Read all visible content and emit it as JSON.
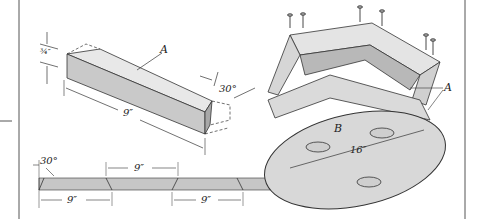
{
  "diagram": {
    "type": "woodworking-assembly-illustration",
    "colors": {
      "line": "#333333",
      "wood_light": "#e6e6e6",
      "wood_mid": "#cfcfcf",
      "wood_dark": "#a8a8a8",
      "disk": "#d9d9d9",
      "border": "#555555"
    },
    "piece_detail": {
      "part_label": "A",
      "thickness_label": "¾″",
      "length_label": "9″",
      "angle_label": "30°"
    },
    "cutting_layout": {
      "angle_label": "30°",
      "dimension_labels": [
        "9″",
        "9″",
        "9″"
      ]
    },
    "assembly": {
      "frame_label": "A",
      "base_label": "B",
      "diameter_label": "16″",
      "nail_count": 6,
      "hole_count": 3
    }
  }
}
